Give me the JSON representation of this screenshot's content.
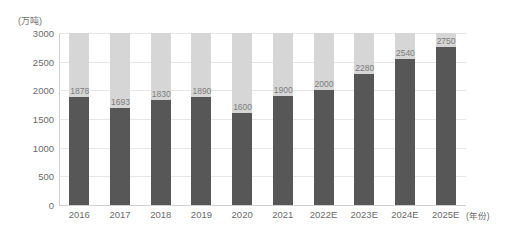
{
  "chart_data": {
    "type": "bar",
    "title": "",
    "xlabel": "(年份)",
    "ylabel": "(万吨)",
    "categories": [
      "2016",
      "2017",
      "2018",
      "2019",
      "2020",
      "2021",
      "2022E",
      "2023E",
      "2024E",
      "2025E"
    ],
    "values": [
      1878,
      1693,
      1830,
      1890,
      1600,
      1900,
      2000,
      2280,
      2540,
      2750
    ],
    "data_labels": [
      "1878",
      "1693",
      "1830",
      "1890",
      "1600",
      "1900",
      "2000",
      "2280",
      "2540",
      "2750"
    ],
    "series": [
      {
        "name": "value",
        "values": [
          1878,
          1693,
          1830,
          1890,
          1600,
          1900,
          2000,
          2280,
          2540,
          2750
        ],
        "color": "#575757"
      },
      {
        "name": "background-cap",
        "values": [
          3000,
          3000,
          3000,
          3000,
          3000,
          3000,
          3000,
          3000,
          3000,
          3000
        ],
        "color": "#d6d6d6"
      }
    ],
    "ylim": [
      0,
      3000
    ],
    "yticks": [
      "0",
      "500",
      "1000",
      "1500",
      "2000",
      "2500",
      "3000"
    ],
    "ytick_values": [
      0,
      500,
      1000,
      1500,
      2000,
      2500,
      3000
    ],
    "grid": true,
    "legend": "none",
    "stacked_to_max": true,
    "colors": {
      "bar_value": "#575757",
      "bar_cap": "#d6d6d6",
      "grid": "#e6e6e6",
      "axis": "#cfcfcf",
      "text": "#6a6a6a",
      "label_text": "#7c7c7c",
      "background": "#ffffff"
    }
  }
}
